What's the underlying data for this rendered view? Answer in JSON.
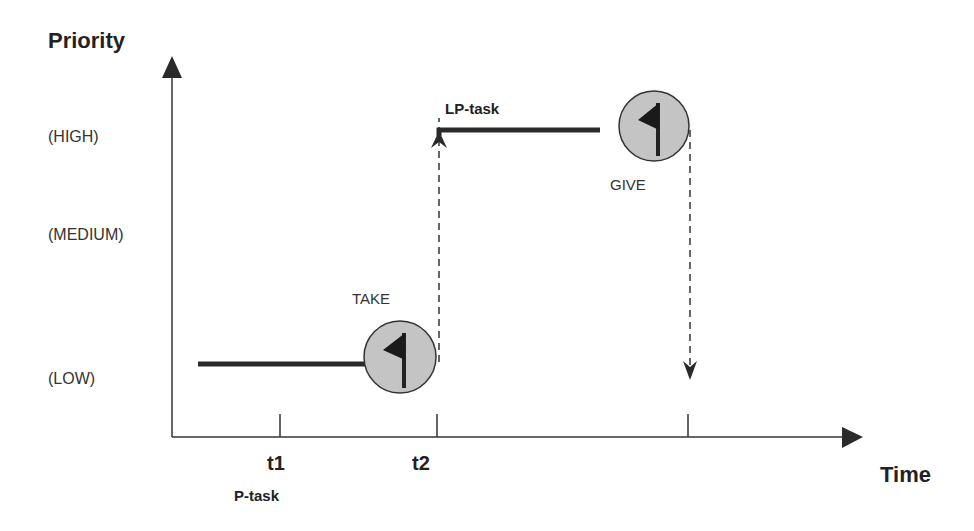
{
  "diagram": {
    "y_axis": {
      "title": "Priority",
      "levels": [
        "(HIGH)",
        "(MEDIUM)",
        "(LOW)"
      ]
    },
    "x_axis": {
      "title": "Time",
      "ticks": [
        "t1",
        "t2"
      ]
    },
    "tasks": {
      "p_task": "P-task",
      "lp_task": "LP-task"
    },
    "events": {
      "take": "TAKE",
      "give": "GIVE"
    },
    "icons": {
      "take": "flag-icon",
      "give": "flag-icon"
    },
    "colors": {
      "line": "#2a2a2a",
      "circle_fill": "#c4c4c4",
      "background": "#ffffff"
    }
  }
}
